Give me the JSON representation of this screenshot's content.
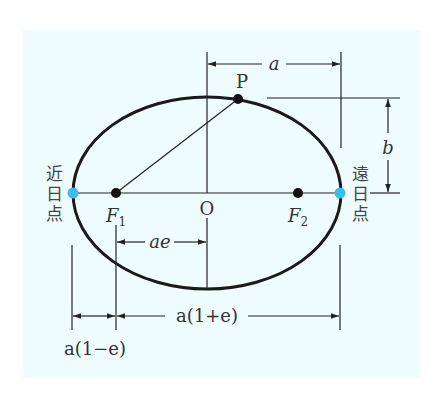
{
  "diagram": {
    "title": "",
    "colors": {
      "background": "#effcfd",
      "line": "#222222",
      "focus_dot": "#111111",
      "apsis_dot": "#3cbcea"
    },
    "labels": {
      "point_p": "P",
      "center_o": "O",
      "focus1": "F",
      "focus1_sub": "1",
      "focus2": "F",
      "focus2_sub": "2",
      "semi_major": "a",
      "semi_minor": "b",
      "focal_distance": "ae",
      "aphelion_distance": "a(1+e)",
      "perihelion_distance": "a(1−e)",
      "perihelion": [
        "近",
        "日",
        "点"
      ],
      "aphelion": [
        "遠",
        "日",
        "点"
      ]
    }
  }
}
